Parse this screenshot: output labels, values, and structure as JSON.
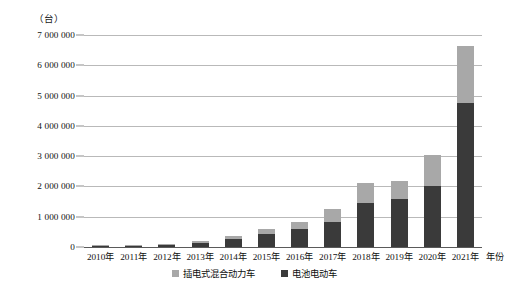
{
  "chart_data": {
    "type": "bar",
    "subtype": "stacked-bar",
    "title": "",
    "unit_label": "（台）",
    "xlabel": "年份",
    "ylabel": "",
    "ylim": [
      0,
      7000000
    ],
    "ytick_step": 1000000,
    "grid": true,
    "legend_position": "bottom-center",
    "categories": [
      "2010年",
      "2011年",
      "2012年",
      "2013年",
      "2014年",
      "2015年",
      "2016年",
      "2017年",
      "2018年",
      "2019年",
      "2020年",
      "2021年"
    ],
    "ytick_labels": [
      "0",
      "1 000 000",
      "2 000 000",
      "3 000 000",
      "4 000 000",
      "5 000 000",
      "6 000 000",
      "7 000 000"
    ],
    "ytick_values": [
      0,
      1000000,
      2000000,
      3000000,
      4000000,
      5000000,
      6000000,
      7000000
    ],
    "series": [
      {
        "name": "电池电动车",
        "color": "#3a3a3a",
        "values": [
          7000,
          35000,
          60000,
          130000,
          250000,
          420000,
          600000,
          840000,
          1450000,
          1570000,
          2000000,
          4750000
        ]
      },
      {
        "name": "插电式混合动力车",
        "color": "#a8a8a8",
        "values": [
          3000,
          15000,
          35000,
          60000,
          110000,
          190000,
          220000,
          400000,
          650000,
          600000,
          1050000,
          1900000
        ]
      }
    ],
    "totals": [
      10000,
      50000,
      95000,
      190000,
      360000,
      610000,
      820000,
      1240000,
      2100000,
      2170000,
      3050000,
      6650000
    ]
  },
  "legend": {
    "items": [
      {
        "label": "插电式混合动力车",
        "color": "#a8a8a8"
      },
      {
        "label": "电池电动车",
        "color": "#3a3a3a"
      }
    ]
  }
}
